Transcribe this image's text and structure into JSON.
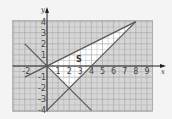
{
  "chart_data": {
    "type": "line",
    "title": "",
    "xlabel": "x",
    "ylabel": "y",
    "xlim": [
      -3,
      9.5
    ],
    "ylim": [
      -4,
      4
    ],
    "grid": true,
    "x_ticks": [
      "-2",
      "1",
      "2",
      "3",
      "4",
      "5",
      "6",
      "7",
      "8",
      "9"
    ],
    "y_ticks": [
      "4",
      "3",
      "2",
      "1",
      "-1",
      "-2",
      "-3",
      "-4"
    ],
    "series": [
      {
        "name": "y = x/2",
        "points": [
          [
            -2,
            -1
          ],
          [
            8,
            4
          ]
        ]
      },
      {
        "name": "y = -x",
        "points": [
          [
            -2,
            2
          ],
          [
            4,
            -4
          ]
        ]
      },
      {
        "name": "y = x - 4",
        "points": [
          [
            0,
            -4
          ],
          [
            8,
            4
          ]
        ]
      }
    ],
    "region": {
      "label": "S",
      "vertices": [
        [
          0,
          0
        ],
        [
          8,
          4
        ],
        [
          2,
          -2
        ]
      ],
      "fill": "#ffffff"
    },
    "annotations": [
      {
        "text": "S",
        "x": 2.8,
        "y": 0.6
      }
    ]
  },
  "colors": {
    "grid_bg": "#d6d6d6",
    "grid_line": "#a8a8a8",
    "line": "#555555",
    "axis": "#222222"
  }
}
